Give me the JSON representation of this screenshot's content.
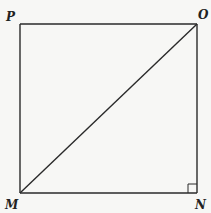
{
  "diagram": {
    "type": "square-with-diagonal",
    "stroke_color": "#2a2a2a",
    "background": "#f7f7f5",
    "vertices": [
      {
        "label": "P",
        "x": 20,
        "y": 24,
        "label_x": 6,
        "label_y": 21
      },
      {
        "label": "O",
        "x": 197,
        "y": 24,
        "label_x": 198,
        "label_y": 19
      },
      {
        "label": "M",
        "x": 20,
        "y": 193,
        "label_x": 6,
        "label_y": 209
      },
      {
        "label": "N",
        "x": 197,
        "y": 193,
        "label_x": 195,
        "label_y": 209
      }
    ],
    "segments": [
      {
        "from": "P",
        "to": "O"
      },
      {
        "from": "O",
        "to": "N"
      },
      {
        "from": "N",
        "to": "M"
      },
      {
        "from": "M",
        "to": "P"
      },
      {
        "from": "M",
        "to": "O",
        "role": "diagonal"
      }
    ],
    "right_angle_marker": {
      "at": "N",
      "size": 9
    }
  }
}
